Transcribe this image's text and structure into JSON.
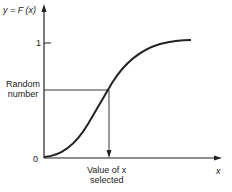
{
  "diagram": {
    "y_axis_label": "y = F (x)",
    "x_axis_label": "x",
    "y_tick_top": "1",
    "origin_label": "0",
    "random_number_label": [
      "Random",
      "number"
    ],
    "value_selected_label": [
      "Value of x",
      "selected"
    ]
  },
  "colors": {
    "line": "#222222",
    "background": "#ffffff"
  }
}
